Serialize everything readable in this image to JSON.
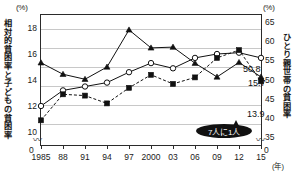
{
  "axes": {
    "unit_left": "(%)",
    "unit_right": "(%)",
    "title_left": "相対的貧困率と子どもの貧困率",
    "title_right": "ひとり親世帯の貧困率",
    "x_unit": "(年)",
    "zero_left": "0",
    "zero_right": "0",
    "break_glyph": "〰"
  },
  "value_labels": {
    "single_parent": "50.8",
    "relative": "15.7",
    "child": "13.9"
  },
  "callout": {
    "text": "7人に1人"
  },
  "chart_data": {
    "type": "line",
    "title": "",
    "xlabel": "(年)",
    "ylabel": "相対的貧困率と子どもの貧困率",
    "y2label": "ひとり親世帯の貧困率",
    "grid": true,
    "legend": "none",
    "categories": [
      "1985",
      "88",
      "91",
      "94",
      "97",
      "2000",
      "03",
      "06",
      "09",
      "12",
      "15"
    ],
    "x_tick_labels": [
      "1985",
      "88",
      "91",
      "94",
      "97",
      "2000",
      "03",
      "06",
      "09",
      "12",
      "15"
    ],
    "ylim": [
      9,
      19
    ],
    "y_tick_labels": [
      "18",
      "16",
      "14",
      "12",
      "10"
    ],
    "y_ticks": [
      18,
      16,
      14,
      12,
      10
    ],
    "y2lim": [
      33,
      67
    ],
    "y2_tick_labels": [
      "65",
      "60",
      "55",
      "50",
      "45",
      "40",
      "35"
    ],
    "y2_ticks": [
      65,
      60,
      55,
      50,
      45,
      40,
      35
    ],
    "series": [
      {
        "name": "ひとり親世帯の貧困率",
        "axis": "right",
        "marker": "triangle",
        "line": "solid",
        "values": [
          54.5,
          51.5,
          50.2,
          53.4,
          63.1,
          58.4,
          58.6,
          54.4,
          50.8,
          54.6,
          50.8
        ],
        "end_label": "50.8"
      },
      {
        "name": "相対的貧困率",
        "axis": "left",
        "marker": "open-circle",
        "line": "solid",
        "values": [
          12.0,
          13.2,
          13.5,
          13.8,
          14.6,
          15.3,
          14.9,
          15.7,
          16.0,
          16.1,
          15.7
        ],
        "end_label": "15.7"
      },
      {
        "name": "子どもの貧困率",
        "axis": "left",
        "marker": "filled-square",
        "line": "dashed",
        "values": [
          10.9,
          12.9,
          12.8,
          12.2,
          13.4,
          14.4,
          13.7,
          14.2,
          15.7,
          16.3,
          13.9
        ],
        "end_label": "13.9"
      }
    ],
    "annotations": [
      {
        "text": "7人に1人",
        "style": "black-bubble",
        "points_to": "子どもの貧困率 2015"
      }
    ]
  }
}
